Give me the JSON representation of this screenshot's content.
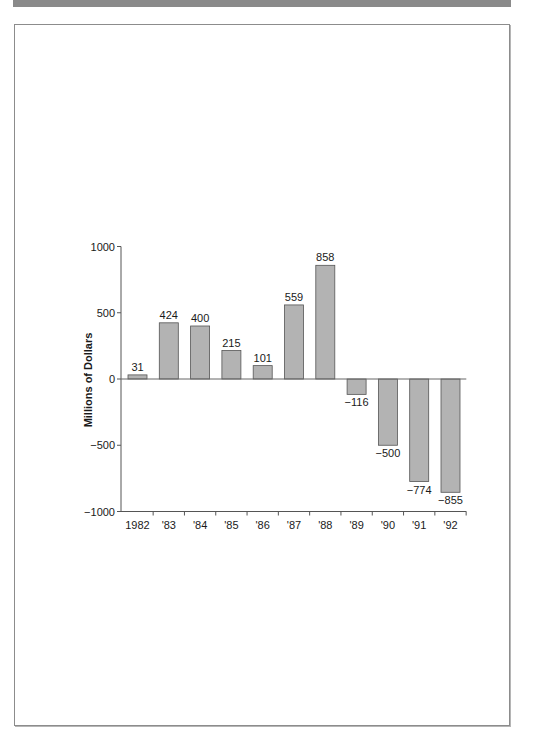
{
  "banner": {
    "color": "#8a8a8a"
  },
  "chart_data": {
    "type": "bar",
    "title": "",
    "xlabel": "",
    "ylabel": "Millions of Dollars",
    "categories": [
      "1982",
      "'83",
      "'84",
      "'85",
      "'86",
      "'87",
      "'88",
      "'89",
      "'90",
      "'91",
      "'92"
    ],
    "values": [
      31,
      424,
      400,
      215,
      101,
      559,
      858,
      -116,
      -500,
      -774,
      -855
    ],
    "value_labels": [
      "31",
      "424",
      "400",
      "215",
      "101",
      "559",
      "858",
      "−116",
      "−500",
      "−774",
      "−855"
    ],
    "ylim": [
      -1000,
      1000
    ],
    "yticks": [
      1000,
      500,
      0,
      -500,
      -1000
    ],
    "ytick_labels": [
      "1000",
      "500",
      "0",
      "−500",
      "−1000"
    ],
    "grid": false,
    "legend": null,
    "bar_color": "#b3b3b3",
    "bar_edge_color": "#555555"
  }
}
